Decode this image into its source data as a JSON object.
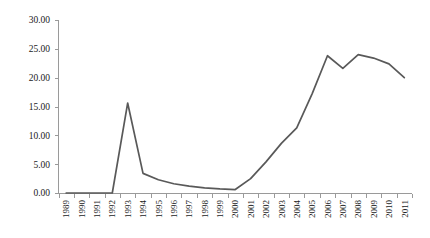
{
  "chart_data": {
    "type": "line",
    "title": "",
    "subtitle": "",
    "xlabel": "",
    "ylabel": "",
    "categories": [
      "1989",
      "1990",
      "1991",
      "1992",
      "1993",
      "1994",
      "1995",
      "1996",
      "1997",
      "1998",
      "1999",
      "2000",
      "2001",
      "2002",
      "2003",
      "2004",
      "2005",
      "2006",
      "2007",
      "2008",
      "2009",
      "2010",
      "2011"
    ],
    "values": [
      0.0,
      0.0,
      0.0,
      0.0,
      15.6,
      3.4,
      2.3,
      1.6,
      1.2,
      0.9,
      0.7,
      0.6,
      2.5,
      5.4,
      8.6,
      11.3,
      17.2,
      23.8,
      21.6,
      24.0,
      23.4,
      22.4,
      20.0
    ],
    "series": [
      {
        "name": "series-1",
        "color": "#595959",
        "values": [
          0.0,
          0.0,
          0.0,
          0.0,
          15.6,
          3.4,
          2.3,
          1.6,
          1.2,
          0.9,
          0.7,
          0.6,
          2.5,
          5.4,
          8.6,
          11.3,
          17.2,
          23.8,
          21.6,
          24.0,
          23.4,
          22.4,
          20.0
        ]
      }
    ],
    "ylim": [
      0,
      30
    ],
    "yticks": [
      0,
      5,
      10,
      15,
      20,
      25,
      30
    ],
    "ytick_labels": [
      "0.00",
      "5.00",
      "10.00",
      "15.00",
      "20.00",
      "25.00",
      "30.00"
    ],
    "grid": false,
    "legend": false,
    "legend_position": "none",
    "annotations": []
  },
  "style": {
    "line_color": "#595959",
    "axis_color": "#9a9a9a",
    "text_color": "#1a1a1a",
    "background": "#ffffff"
  }
}
